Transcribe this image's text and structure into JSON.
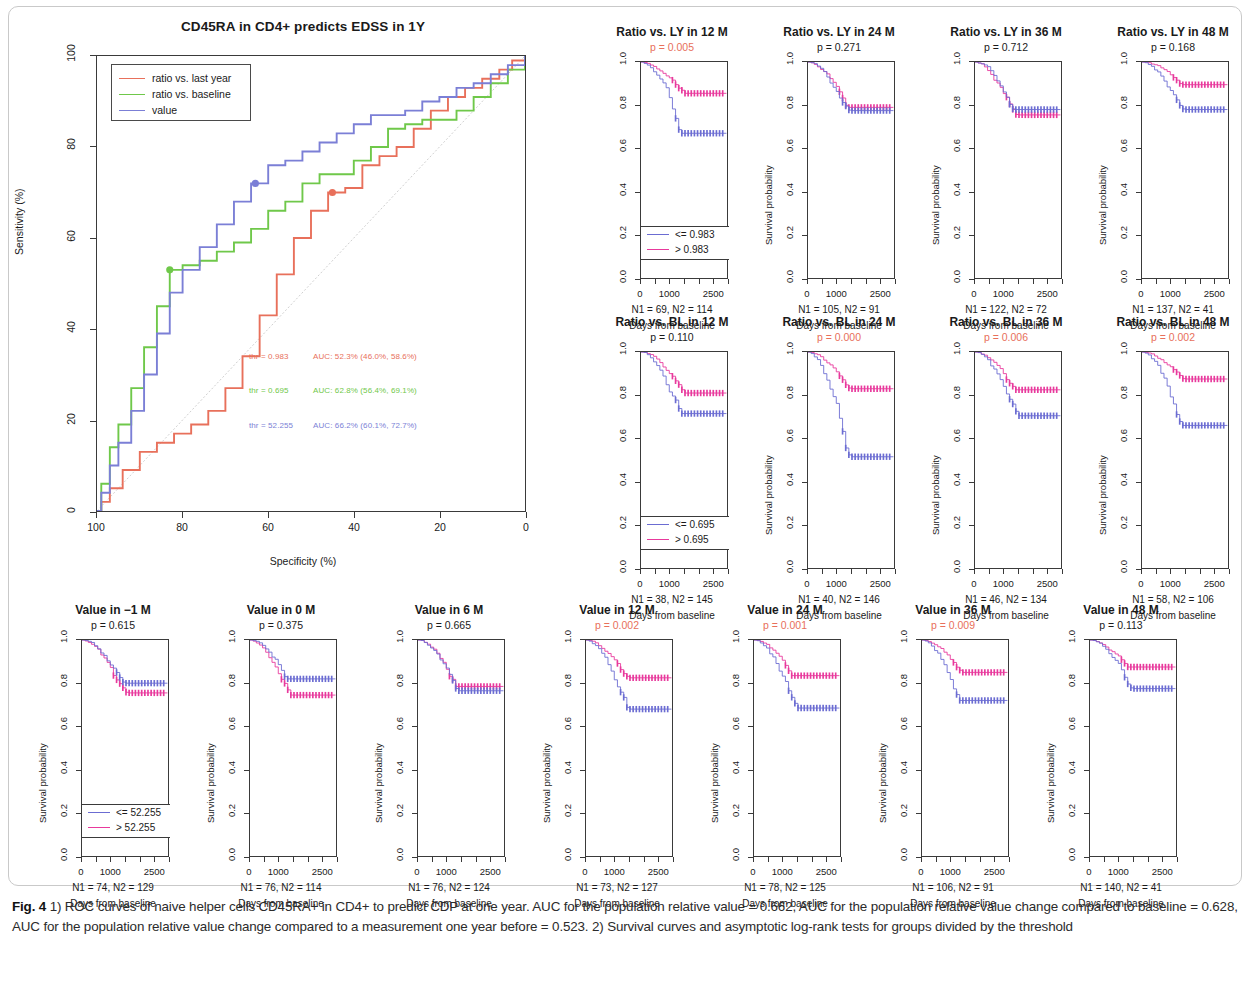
{
  "figure": {
    "caption_label": "Fig. 4",
    "caption_text": " 1) ROC curves of naive helper cells CD45RA+ in CD4+ to predict CDP at one year. AUC for the population relative value = 0.662, AUC for the population relative value change compared to baseline = 0.628, AUC for the population relative value change compared to a measurement one year before = 0.523. 2) Survival curves and asymptotic log-rank tests for groups divided by the threshold"
  },
  "colors": {
    "red": "#e8705b",
    "green": "#6fc84a",
    "blue": "#7b7fd6",
    "pink": "#e8399c",
    "purple": "#6b6cd2",
    "diagonal": "#cfcfcf",
    "axis": "#3a3a3a",
    "sig_p": "#e8705b"
  },
  "roc": {
    "title": "CD45RA in CD4+ predicts EDSS in 1Y",
    "xlabel": "Specificity (%)",
    "ylabel": "Sensitivity (%)",
    "xticks": [
      "100",
      "80",
      "60",
      "40",
      "20",
      "0"
    ],
    "yticks": [
      "0",
      "20",
      "40",
      "60",
      "80",
      "100"
    ],
    "legend": [
      {
        "label": "ratio vs. last year",
        "color": "#e8705b"
      },
      {
        "label": "ratio vs. baseline",
        "color": "#6fc84a"
      },
      {
        "label": "value",
        "color": "#7b7fd6"
      }
    ],
    "annotations": [
      {
        "thr": "thr = 0.983",
        "auc": "AUC: 52.3% (46.0%, 58.6%)",
        "color": "#e8705b"
      },
      {
        "thr": "thr = 0.695",
        "auc": "AUC: 62.8% (56.4%, 69.1%)",
        "color": "#6fc84a"
      },
      {
        "thr": "thr = 52.255",
        "auc": "AUC: 66.2% (60.1%, 72.7%)",
        "color": "#7b7fd6"
      }
    ]
  },
  "chart_data": {
    "type": "line",
    "title": "CD45RA in CD4+ predicts EDSS in 1Y",
    "xlabel": "Specificity (%)",
    "ylabel": "Sensitivity (%)",
    "xlim": [
      100,
      0
    ],
    "ylim": [
      0,
      100
    ],
    "grid": false,
    "legend_position": "top-left",
    "series": [
      {
        "name": "ratio vs. last year",
        "color": "#e8705b",
        "auc": 0.523,
        "auc_label": "AUC: 52.3% (46.0%, 58.6%)",
        "threshold": 0.983,
        "threshold_label": "thr = 0.983",
        "operating_point": {
          "specificity": 45,
          "sensitivity": 70
        },
        "x": [
          100,
          99,
          97,
          94,
          90,
          86,
          82,
          78,
          74,
          70,
          66,
          62,
          58,
          54,
          50,
          46,
          42,
          38,
          34,
          30,
          26,
          22,
          18,
          14,
          10,
          6,
          3,
          0
        ],
        "y": [
          0,
          2,
          5,
          9,
          13,
          15,
          17,
          19,
          22,
          27,
          34,
          43,
          52,
          60,
          66,
          70,
          71,
          76,
          78,
          80,
          84,
          88,
          91,
          93,
          95,
          97,
          99,
          100
        ]
      },
      {
        "name": "ratio vs. baseline",
        "color": "#6fc84a",
        "auc": 0.628,
        "auc_label": "AUC: 62.8% (56.4%, 69.1%)",
        "threshold": 0.695,
        "threshold_label": "thr = 0.695",
        "operating_point": {
          "specificity": 83,
          "sensitivity": 53
        },
        "x": [
          100,
          99,
          97,
          95,
          92,
          89,
          86,
          83,
          80,
          76,
          72,
          68,
          64,
          60,
          56,
          52,
          48,
          44,
          40,
          36,
          32,
          28,
          24,
          20,
          16,
          12,
          8,
          4,
          0
        ],
        "y": [
          0,
          6,
          14,
          19,
          27,
          36,
          45,
          53,
          54,
          55,
          57,
          59,
          62,
          66,
          68,
          72,
          74,
          74,
          77,
          80,
          84,
          85,
          86,
          86,
          88,
          91,
          94,
          97,
          100
        ]
      },
      {
        "name": "value",
        "color": "#7b7fd6",
        "auc": 0.662,
        "auc_label": "AUC: 66.2% (60.1%, 72.7%)",
        "threshold": 52.255,
        "threshold_label": "thr = 52.255",
        "operating_point": {
          "specificity": 63,
          "sensitivity": 72
        },
        "x": [
          100,
          99,
          97,
          95,
          92,
          89,
          86,
          83,
          80,
          76,
          72,
          68,
          64,
          60,
          56,
          52,
          48,
          44,
          40,
          36,
          32,
          28,
          24,
          20,
          16,
          12,
          8,
          4,
          0
        ],
        "y": [
          0,
          4,
          10,
          15,
          22,
          30,
          39,
          48,
          53,
          58,
          63,
          68,
          72,
          76,
          77,
          79,
          81,
          83,
          85,
          87,
          87,
          88,
          90,
          91,
          93,
          94,
          96,
          98,
          100
        ]
      }
    ]
  },
  "survival": {
    "ylabel": "Survival probability",
    "xlabel": "Days from baseline",
    "yticks": [
      "0.0",
      "0.2",
      "0.4",
      "0.6",
      "0.8",
      "1.0"
    ],
    "xticks": [
      "0",
      "1000",
      "2500"
    ],
    "panels": [
      {
        "title": "Ratio vs. LY in 12 M",
        "p": "p = 0.005",
        "significant": true,
        "n": "N1 = 69, N2 = 114",
        "legend": [
          {
            "label": "<= 0.983",
            "color": "#6b6cd2"
          },
          {
            "label": "> 0.983",
            "color": "#e8399c"
          }
        ],
        "show_legend": true,
        "show_ylabel": false,
        "low_end": 0.67,
        "high_end": 0.855
      },
      {
        "title": "Ratio vs. LY in 24 M",
        "p": "p = 0.271",
        "significant": false,
        "n": "N1 = 105, N2 = 91",
        "legend": [
          {
            "label": "<= 0.983",
            "color": "#6b6cd2"
          },
          {
            "label": "> 0.983",
            "color": "#e8399c"
          }
        ],
        "show_legend": false,
        "show_ylabel": true,
        "low_end": 0.775,
        "high_end": 0.79
      },
      {
        "title": "Ratio vs. LY in 36 M",
        "p": "p = 0.712",
        "significant": false,
        "n": "N1 = 122, N2 = 72",
        "legend": [
          {
            "label": "<= 0.983",
            "color": "#6b6cd2"
          },
          {
            "label": "> 0.983",
            "color": "#e8399c"
          }
        ],
        "show_legend": false,
        "show_ylabel": true,
        "low_end": 0.78,
        "high_end": 0.755
      },
      {
        "title": "Ratio vs. LY in 48 M",
        "p": "p = 0.168",
        "significant": false,
        "n": "N1 = 137, N2 = 41",
        "legend": [
          {
            "label": "<= 0.983",
            "color": "#6b6cd2"
          },
          {
            "label": "> 0.983",
            "color": "#e8399c"
          }
        ],
        "show_legend": false,
        "show_ylabel": true,
        "low_end": 0.78,
        "high_end": 0.895
      },
      {
        "title": "Ratio vs. BL in 12 M",
        "p": "p = 0.110",
        "significant": false,
        "n": "N1 = 38, N2 = 145",
        "legend": [
          {
            "label": "<= 0.695",
            "color": "#6b6cd2"
          },
          {
            "label": "> 0.695",
            "color": "#e8399c"
          }
        ],
        "show_legend": true,
        "show_ylabel": false,
        "low_end": 0.715,
        "high_end": 0.81
      },
      {
        "title": "Ratio vs. BL in 24 M",
        "p": "p = 0.000",
        "significant": true,
        "n": "N1 = 40, N2 = 146",
        "legend": [
          {
            "label": "<= 0.695",
            "color": "#6b6cd2"
          },
          {
            "label": "> 0.695",
            "color": "#e8399c"
          }
        ],
        "show_legend": false,
        "show_ylabel": true,
        "low_end": 0.515,
        "high_end": 0.83
      },
      {
        "title": "Ratio vs. BL in 36 M",
        "p": "p = 0.006",
        "significant": true,
        "n": "N1 = 46, N2 = 134",
        "legend": [
          {
            "label": "<= 0.695",
            "color": "#6b6cd2"
          },
          {
            "label": "> 0.695",
            "color": "#e8399c"
          }
        ],
        "show_legend": false,
        "show_ylabel": true,
        "low_end": 0.705,
        "high_end": 0.825
      },
      {
        "title": "Ratio vs. BL in 48 M",
        "p": "p = 0.002",
        "significant": true,
        "n": "N1 = 58, N2 = 106",
        "legend": [
          {
            "label": "<= 0.695",
            "color": "#6b6cd2"
          },
          {
            "label": "> 0.695",
            "color": "#e8399c"
          }
        ],
        "show_legend": false,
        "show_ylabel": true,
        "low_end": 0.66,
        "high_end": 0.875
      },
      {
        "title": "Value in −1 M",
        "p": "p = 0.615",
        "significant": false,
        "n": "N1 = 74, N2 = 129",
        "legend": [
          {
            "label": "<= 52.255",
            "color": "#6b6cd2"
          },
          {
            "label": "> 52.255",
            "color": "#e8399c"
          }
        ],
        "show_legend": true,
        "show_ylabel": true,
        "low_end": 0.8,
        "high_end": 0.755
      },
      {
        "title": "Value in 0 M",
        "p": "p = 0.375",
        "significant": false,
        "n": "N1 = 76, N2 = 114",
        "legend": [
          {
            "label": "<= 52.255",
            "color": "#6b6cd2"
          },
          {
            "label": "> 52.255",
            "color": "#e8399c"
          }
        ],
        "show_legend": false,
        "show_ylabel": true,
        "low_end": 0.82,
        "high_end": 0.745
      },
      {
        "title": "Value in 6 M",
        "p": "p = 0.665",
        "significant": false,
        "n": "N1 = 76, N2 = 124",
        "legend": [
          {
            "label": "<= 52.255",
            "color": "#6b6cd2"
          },
          {
            "label": "> 52.255",
            "color": "#e8399c"
          }
        ],
        "show_legend": false,
        "show_ylabel": true,
        "low_end": 0.765,
        "high_end": 0.785
      },
      {
        "title": "Value in 12 M",
        "p": "p = 0.002",
        "significant": true,
        "n": "N1 = 73, N2 = 127",
        "legend": [
          {
            "label": "<= 52.255",
            "color": "#6b6cd2"
          },
          {
            "label": "> 52.255",
            "color": "#e8399c"
          }
        ],
        "show_legend": false,
        "show_ylabel": true,
        "low_end": 0.68,
        "high_end": 0.825
      },
      {
        "title": "Value in 24 M",
        "p": "p = 0.001",
        "significant": true,
        "n": "N1 = 78, N2 = 125",
        "legend": [
          {
            "label": "<= 52.255",
            "color": "#6b6cd2"
          },
          {
            "label": "> 52.255",
            "color": "#e8399c"
          }
        ],
        "show_legend": false,
        "show_ylabel": true,
        "low_end": 0.685,
        "high_end": 0.835
      },
      {
        "title": "Value in 36 M",
        "p": "p = 0.009",
        "significant": true,
        "n": "N1 = 106, N2 = 91",
        "legend": [
          {
            "label": "<= 52.255",
            "color": "#6b6cd2"
          },
          {
            "label": "> 52.255",
            "color": "#e8399c"
          }
        ],
        "show_legend": false,
        "show_ylabel": true,
        "low_end": 0.72,
        "high_end": 0.85
      },
      {
        "title": "Value in 48 M",
        "p": "p = 0.113",
        "significant": false,
        "n": "N1 = 140, N2 = 41",
        "legend": [
          {
            "label": "<= 52.255",
            "color": "#6b6cd2"
          },
          {
            "label": "> 52.255",
            "color": "#e8399c"
          }
        ],
        "show_legend": false,
        "show_ylabel": true,
        "low_end": 0.775,
        "high_end": 0.875
      }
    ]
  }
}
